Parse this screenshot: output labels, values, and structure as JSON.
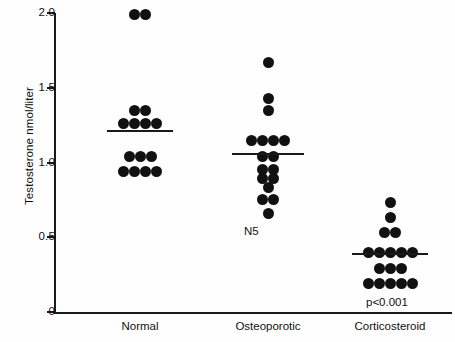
{
  "chart_data": {
    "type": "scatter",
    "title": "",
    "xlabel": "",
    "ylabel": "Testosterone nmol/liter",
    "ylim": [
      0,
      2.0
    ],
    "yticks": [
      "0",
      "0.5",
      "1.0",
      "1.5",
      "2.0"
    ],
    "ytick_values": [
      0,
      0.5,
      1.0,
      1.5,
      2.0
    ],
    "grid": false,
    "legend": "none",
    "categories": [
      "Normal",
      "Osteoporotic",
      "Corticosteroid"
    ],
    "groups": [
      {
        "name": "Normal",
        "n": 15,
        "mean": 1.21,
        "mean_line": true,
        "values": [
          1.99,
          1.99,
          1.35,
          1.35,
          1.26,
          1.26,
          1.26,
          1.26,
          1.04,
          1.04,
          1.04,
          0.94,
          0.94,
          0.94,
          0.94
        ],
        "stacks": [
          {
            "value": 1.99,
            "count": 2
          },
          {
            "value": 1.35,
            "count": 2
          },
          {
            "value": 1.26,
            "count": 4
          },
          {
            "value": 1.04,
            "count": 3
          },
          {
            "value": 0.94,
            "count": 4
          }
        ],
        "annotation": ""
      },
      {
        "name": "Osteoporotic",
        "n": 17,
        "mean": 1.06,
        "mean_line": true,
        "values": [
          1.67,
          1.43,
          1.35,
          1.15,
          1.15,
          1.15,
          1.15,
          1.04,
          1.04,
          0.95,
          0.95,
          0.89,
          0.89,
          0.83,
          0.75,
          0.75,
          0.66
        ],
        "stacks": [
          {
            "value": 1.67,
            "count": 1
          },
          {
            "value": 1.43,
            "count": 1
          },
          {
            "value": 1.35,
            "count": 1
          },
          {
            "value": 1.15,
            "count": 4
          },
          {
            "value": 1.04,
            "count": 2
          },
          {
            "value": 0.95,
            "count": 2
          },
          {
            "value": 0.89,
            "count": 2
          },
          {
            "value": 0.83,
            "count": 1
          },
          {
            "value": 0.75,
            "count": 2
          },
          {
            "value": 0.66,
            "count": 1
          }
        ],
        "annotation": "N5"
      },
      {
        "name": "Corticosteroid",
        "n": 17,
        "mean": 0.385,
        "mean_line": true,
        "values": [
          0.73,
          0.63,
          0.53,
          0.53,
          0.4,
          0.4,
          0.4,
          0.4,
          0.4,
          0.29,
          0.29,
          0.29,
          0.19,
          0.19,
          0.19,
          0.19,
          0.19
        ],
        "stacks": [
          {
            "value": 0.73,
            "count": 1
          },
          {
            "value": 0.63,
            "count": 1
          },
          {
            "value": 0.53,
            "count": 2
          },
          {
            "value": 0.4,
            "count": 5
          },
          {
            "value": 0.29,
            "count": 3
          },
          {
            "value": 0.19,
            "count": 5
          }
        ],
        "annotation": "p<0.001"
      }
    ]
  },
  "axis": {
    "y_title": "Testosterone nmol/liter",
    "ticks": [
      {
        "label": "2.0",
        "value": 2.0
      },
      {
        "label": "1.5",
        "value": 1.5
      },
      {
        "label": "1.0",
        "value": 1.0
      },
      {
        "label": "0.5",
        "value": 0.5
      },
      {
        "label": "0",
        "value": 0.0
      }
    ]
  },
  "colors": {
    "dot": "#111111",
    "axis": "#1a1a1a",
    "background": "#ffffff",
    "text": "#111111"
  }
}
